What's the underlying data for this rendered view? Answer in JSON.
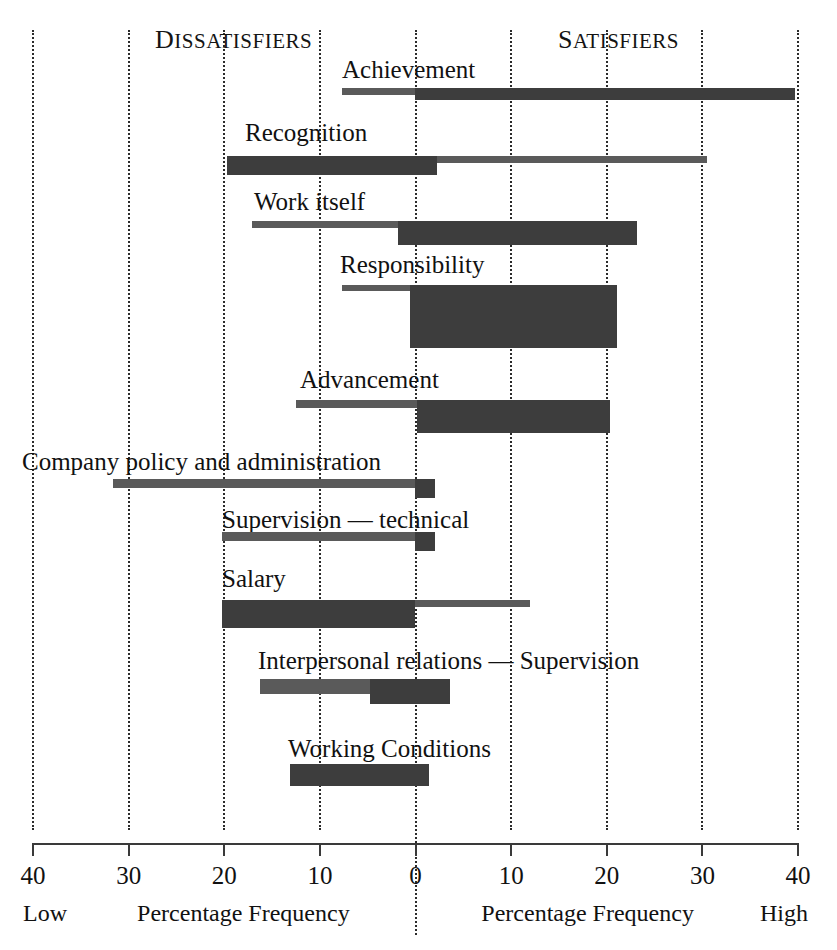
{
  "headers": {
    "left": "Dissatisfiers",
    "right": "Satisfiers"
  },
  "axis": {
    "tick_labels": [
      "40",
      "30",
      "20",
      "10",
      "0",
      "10",
      "20",
      "30",
      "40"
    ],
    "tick_values": [
      -40,
      -30,
      -20,
      -10,
      0,
      10,
      20,
      30,
      40
    ],
    "footer_low": "Low",
    "footer_high": "High",
    "footer_left": "Percentage Frequency",
    "footer_right": "Percentage Frequency"
  },
  "colors": {
    "thin_bar": "#5a5a5a",
    "thick_bar": "#3d3d3d",
    "gridline": "#2b2b2b",
    "axis": "#3a3a3a",
    "text": "#111111"
  },
  "chart_data": {
    "type": "bar",
    "title": "",
    "subtitle": "",
    "xlabel": "Percentage Frequency",
    "ylabel": "",
    "xlim": [
      -40,
      40
    ],
    "grid": true,
    "legend": "none",
    "annotations": [
      "Dissatisfiers",
      "Satisfiers",
      "Low",
      "High"
    ],
    "categories": [
      "Achievement",
      "Recognition",
      "Work itself",
      "Responsibility",
      "Advancement",
      "Company policy and administration",
      "Supervision — technical",
      "Salary",
      "Interpersonal relations — Supervision",
      "Working Conditions"
    ],
    "series": [
      {
        "name": "All factors contributing to job dissatisfaction (negative) / satisfaction (positive)",
        "note": "Each bar spans from its negative (dissatisfier) extent to its positive (satisfier) extent",
        "values": [
          {
            "category": "Achievement",
            "neg": -7.7,
            "pos": 39.8
          },
          {
            "category": "Recognition",
            "neg": -19.7,
            "pos": 30.5
          },
          {
            "category": "Work itself",
            "neg": -17.1,
            "pos": 23.2
          },
          {
            "category": "Responsibility",
            "neg": -7.7,
            "pos": 21.1
          },
          {
            "category": "Advancement",
            "neg": -12.5,
            "pos": 20.4
          },
          {
            "category": "Company policy and administration",
            "neg": -31.6,
            "pos": 2.1
          },
          {
            "category": "Supervision — technical",
            "neg": -20.2,
            "pos": 2.1
          },
          {
            "category": "Salary",
            "neg": -20.2,
            "pos": 12.0
          },
          {
            "category": "Interpersonal relations — Supervision",
            "neg": -16.6,
            "pos": 3.6
          },
          {
            "category": "Working Conditions",
            "neg": -13.1,
            "pos": 1.5
          }
        ]
      },
      {
        "name": "Long duration factors (thick bar portion)",
        "note": "Thick inner bar marks the long-duration share of each factor",
        "values": [
          {
            "category": "Achievement",
            "from": 0.0,
            "to": 39.8
          },
          {
            "category": "Recognition",
            "from": -19.7,
            "to": 2.3
          },
          {
            "category": "Work itself",
            "from": -1.8,
            "to": 23.2
          },
          {
            "category": "Responsibility",
            "from": -0.5,
            "to": 21.1
          },
          {
            "category": "Advancement",
            "from": -12.5,
            "to": 20.4
          },
          {
            "category": "Company policy and administration",
            "from": 0.0,
            "to": 2.1
          },
          {
            "category": "Supervision — technical",
            "from": 0.0,
            "to": 2.1
          },
          {
            "category": "Salary",
            "from": -20.2,
            "to": 0.0
          },
          {
            "category": "Interpersonal relations — Supervision",
            "from": -4.7,
            "to": 3.6
          },
          {
            "category": "Working Conditions",
            "from": -13.1,
            "to": 1.5
          }
        ]
      }
    ]
  },
  "rows": [
    {
      "label": "Achievement",
      "label_x": 342,
      "label_y": 57,
      "thin_x1": 342,
      "thin_x2": 795,
      "thin_y": 88,
      "thin_h": 7,
      "thick_x1": 415,
      "thick_x2": 795,
      "thick_y": 88,
      "thick_h": 12
    },
    {
      "label": "Recognition",
      "label_x": 245,
      "label_y": 120,
      "thin_x1": 227,
      "thin_x2": 707,
      "thin_y": 156,
      "thin_h": 7,
      "thick_x1": 227,
      "thick_x2": 437,
      "thick_y": 156,
      "thick_h": 19
    },
    {
      "label": "Work itself",
      "label_x": 254,
      "label_y": 189,
      "thin_x1": 252,
      "thin_x2": 637,
      "thin_y": 221,
      "thin_h": 7,
      "thick_x1": 398,
      "thick_x2": 637,
      "thick_y": 221,
      "thick_h": 24
    },
    {
      "label": "Responsibility",
      "label_x": 340,
      "label_y": 252,
      "thin_x1": 342,
      "thin_x2": 617,
      "thin_y": 285,
      "thin_h": 6,
      "thick_x1": 410,
      "thick_x2": 617,
      "thick_y": 285,
      "thick_h": 63
    },
    {
      "label": "Advancement",
      "label_x": 300,
      "label_y": 367,
      "thin_x1": 296,
      "thin_x2": 610,
      "thin_y": 400,
      "thin_h": 8,
      "thick_x1": 417,
      "thick_x2": 610,
      "thick_y": 400,
      "thick_h": 33
    },
    {
      "label": "Company policy and administration",
      "label_x": 22,
      "label_y": 449,
      "thin_x1": 113,
      "thin_x2": 435,
      "thin_y": 479,
      "thin_h": 9,
      "thick_x1": 415,
      "thick_x2": 435,
      "thick_y": 479,
      "thick_h": 19
    },
    {
      "label": "Supervision — technical",
      "label_x": 222,
      "label_y": 507,
      "thin_x1": 222,
      "thin_x2": 435,
      "thin_y": 532,
      "thin_h": 9,
      "thick_x1": 415,
      "thick_x2": 435,
      "thick_y": 532,
      "thick_h": 19
    },
    {
      "label": "Salary",
      "label_x": 222,
      "label_y": 566,
      "thin_x1": 222,
      "thin_x2": 530,
      "thin_y": 600,
      "thin_h": 7,
      "thick_x1": 222,
      "thick_x2": 415,
      "thick_y": 600,
      "thick_h": 28
    },
    {
      "label": "Interpersonal relations — Supervision",
      "label_x": 258,
      "label_y": 648,
      "thin_x1": 260,
      "thin_x2": 450,
      "thin_y": 679,
      "thin_h": 15,
      "thick_x1": 370,
      "thick_x2": 450,
      "thick_y": 679,
      "thick_h": 25
    },
    {
      "label": "Working Conditions",
      "label_x": 288,
      "label_y": 736,
      "thin_x1": 290,
      "thin_x2": 429,
      "thin_y": 764,
      "thin_h": 22,
      "thick_x1": 290,
      "thick_x2": 429,
      "thick_y": 764,
      "thick_h": 22
    }
  ]
}
